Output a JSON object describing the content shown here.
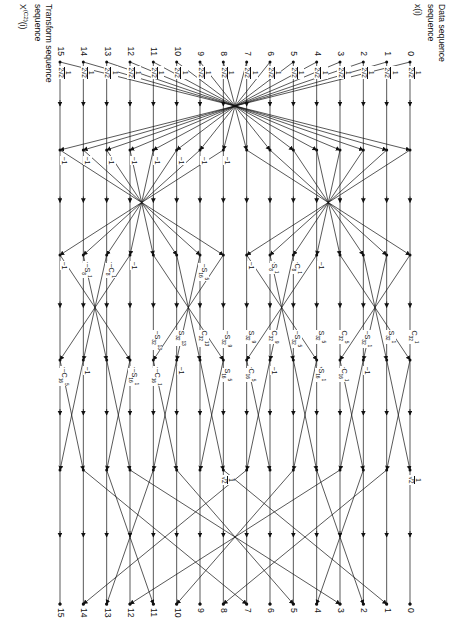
{
  "figure": {
    "kind": "signal-flow-graph",
    "title_top": "Data sequence",
    "title_top_symbol": "x(i)",
    "title_bottom": "Transform sequence",
    "title_bottom_symbol_base": "X",
    "title_bottom_symbol_sup": "(C2)",
    "title_bottom_symbol_arg": "(i)",
    "n_points": 16,
    "indices": [
      "0",
      "1",
      "2",
      "3",
      "4",
      "5",
      "6",
      "7",
      "8",
      "9",
      "10",
      "11",
      "12",
      "13",
      "14",
      "15"
    ],
    "stage_count": 4,
    "ink": "#111111",
    "paper": "#ffffff"
  },
  "scale_labels": {
    "input_scale_num": "1",
    "input_scale_den": "2√2",
    "input_scale_text": "1/(2√2)",
    "half_scale_num": "1",
    "half_scale_den": "√2",
    "half_scale_text": "1/√2",
    "neg_half_scale_text": "-1/√2",
    "minus_one": "−1",
    "sqrt2": "√2",
    "neg_sqrt2": "−√2"
  },
  "coefficients": [
    {
      "id": "c8-1",
      "sign": "",
      "letter": "C",
      "sub": "8",
      "sup": "1"
    },
    {
      "id": "s8-1",
      "sign": "",
      "letter": "S",
      "sub": "8",
      "sup": "1"
    },
    {
      "id": "nc8-1",
      "sign": "−",
      "letter": "C",
      "sub": "8",
      "sup": "1"
    },
    {
      "id": "ns8-1",
      "sign": "−",
      "letter": "S",
      "sub": "8",
      "sup": "1"
    },
    {
      "id": "c16-1",
      "sign": "",
      "letter": "C",
      "sub": "16",
      "sup": "1"
    },
    {
      "id": "s16-1",
      "sign": "",
      "letter": "S",
      "sub": "16",
      "sup": "1"
    },
    {
      "id": "nc16-1",
      "sign": "−",
      "letter": "C",
      "sub": "16",
      "sup": "1"
    },
    {
      "id": "ns16-1",
      "sign": "−",
      "letter": "S",
      "sub": "16",
      "sup": "1"
    },
    {
      "id": "c16-5",
      "sign": "",
      "letter": "C",
      "sub": "16",
      "sup": "5"
    },
    {
      "id": "s16-5",
      "sign": "",
      "letter": "S",
      "sub": "16",
      "sup": "5"
    },
    {
      "id": "nc16-5",
      "sign": "−",
      "letter": "C",
      "sub": "16",
      "sup": "5"
    },
    {
      "id": "ns16-5",
      "sign": "−",
      "letter": "S",
      "sub": "16",
      "sup": "5"
    },
    {
      "id": "c32-1",
      "sign": "",
      "letter": "C",
      "sub": "32",
      "sup": "1"
    },
    {
      "id": "s32-1",
      "sign": "",
      "letter": "S",
      "sub": "32",
      "sup": "1"
    },
    {
      "id": "c32-5",
      "sign": "",
      "letter": "C",
      "sub": "32",
      "sup": "5"
    },
    {
      "id": "s32-5",
      "sign": "",
      "letter": "S",
      "sub": "32",
      "sup": "5"
    },
    {
      "id": "c32-9",
      "sign": "",
      "letter": "C",
      "sub": "32",
      "sup": "9"
    },
    {
      "id": "s32-9",
      "sign": "",
      "letter": "S",
      "sub": "32",
      "sup": "9"
    },
    {
      "id": "c32-13",
      "sign": "",
      "letter": "C",
      "sub": "32",
      "sup": "13"
    },
    {
      "id": "s32-13",
      "sign": "",
      "letter": "S",
      "sub": "32",
      "sup": "13"
    }
  ],
  "annotations": [
    {
      "x": 118,
      "y": 118,
      "text": "C",
      "sub": "32",
      "sup": "1"
    },
    {
      "x": 134,
      "y": 104,
      "text": "S",
      "sub": "32",
      "sup": "1"
    },
    {
      "x": 118,
      "y": 160,
      "text": "S",
      "sub": "32",
      "sup": "1",
      "sign": "−"
    },
    {
      "x": 168,
      "y": 118,
      "text": "C",
      "sub": "32",
      "sup": "5"
    },
    {
      "x": 184,
      "y": 104,
      "text": "S",
      "sub": "32",
      "sup": "5"
    },
    {
      "x": 168,
      "y": 160,
      "text": "S",
      "sub": "32",
      "sup": "5",
      "sign": "−"
    },
    {
      "x": 218,
      "y": 118,
      "text": "C",
      "sub": "32",
      "sup": "9"
    },
    {
      "x": 234,
      "y": 104,
      "text": "S",
      "sub": "32",
      "sup": "9"
    },
    {
      "x": 218,
      "y": 160,
      "text": "S",
      "sub": "32",
      "sup": "9",
      "sign": "−"
    },
    {
      "x": 268,
      "y": 118,
      "text": "C",
      "sub": "32",
      "sup": "13"
    },
    {
      "x": 284,
      "y": 104,
      "text": "S",
      "sub": "32",
      "sup": "13"
    },
    {
      "x": 268,
      "y": 160,
      "text": "S",
      "sub": "32",
      "sup": "13",
      "sign": "−"
    }
  ],
  "chart_data": {
    "type": "diagram",
    "rows": 16,
    "row_labels": [
      "0",
      "1",
      "2",
      "3",
      "4",
      "5",
      "6",
      "7",
      "8",
      "9",
      "10",
      "11",
      "12",
      "13",
      "14",
      "15"
    ],
    "input_label": "x(i)",
    "output_label": "X(C2)(i)",
    "multipliers": [
      "1/(2√2)",
      "1/√2",
      "− 1/√2",
      "−1",
      "√2",
      "−√2",
      "C8^1",
      "S8^1",
      "−C8^1",
      "−S8^1",
      "C16^1",
      "S16^1",
      "−C16^1",
      "−S16^1",
      "C16^5",
      "S16^5",
      "−C16^5",
      "−S16^5",
      "C32^1",
      "S32^1",
      "−S32^1",
      "C32^5",
      "S32^5",
      "−S32^5",
      "C32^9",
      "S32^9",
      "−S32^9",
      "C32^13",
      "S32^13",
      "−S32^13"
    ]
  }
}
